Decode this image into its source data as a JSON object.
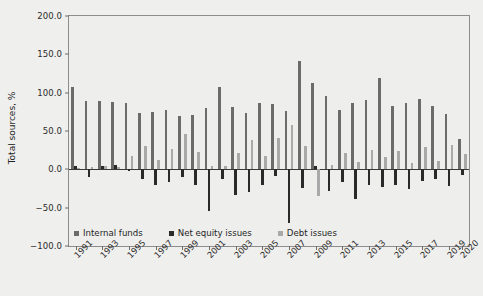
{
  "chart_data": {
    "type": "bar",
    "title": "",
    "xlabel": "",
    "ylabel": "Total sources, %",
    "ylim": [
      -100.0,
      200.0
    ],
    "yticks": [
      200.0,
      150.0,
      100.0,
      50.0,
      0.0,
      -50.0,
      -100.0
    ],
    "ytick_labels": [
      "200.0",
      "150.0",
      "100.0",
      "50.0",
      "0.0",
      "-50.0",
      "-100.0"
    ],
    "grid": false,
    "legend_position": "bottom-left",
    "categories": [
      1991,
      1992,
      1993,
      1994,
      1995,
      1996,
      1997,
      1998,
      1999,
      2000,
      2001,
      2002,
      2003,
      2004,
      2005,
      2006,
      2007,
      2008,
      2009,
      2010,
      2011,
      2012,
      2013,
      2014,
      2015,
      2016,
      2017,
      2018,
      2019,
      2020
    ],
    "xtick_labels": [
      "1991",
      "1993",
      "1995",
      "1997",
      "1999",
      "2001",
      "2003",
      "2005",
      "2007",
      "2009",
      "2011",
      "2013",
      "2015",
      "2017",
      "2019",
      "2020"
    ],
    "series": [
      {
        "name": "Internal funds",
        "color": "#6b6b6b",
        "values": [
          108,
          89,
          89,
          88,
          86,
          74,
          75,
          78,
          70,
          71,
          80,
          107,
          81,
          74,
          87,
          85,
          76,
          141,
          112,
          96,
          78,
          87,
          90,
          119,
          82,
          87,
          92,
          83,
          72,
          40
        ]
      },
      {
        "name": "Net equity issues",
        "color": "#2a2a2a",
        "values": [
          5,
          -10,
          5,
          6,
          -2,
          -13,
          -21,
          -17,
          -10,
          -21,
          -55,
          -12,
          -33,
          -29,
          -21,
          -9,
          -70,
          -25,
          5,
          -28,
          -16,
          -39,
          -21,
          -23,
          -20,
          -26,
          -15,
          -13,
          -22,
          -8
        ]
      },
      {
        "name": "Debt issues",
        "color": "#a9a9a9",
        "values": [
          2,
          3,
          4,
          3,
          17,
          31,
          12,
          26,
          46,
          22,
          5,
          5,
          21,
          38,
          17,
          41,
          58,
          30,
          -35,
          6,
          21,
          9,
          25,
          16,
          24,
          8,
          29,
          11,
          32,
          20
        ]
      }
    ]
  },
  "legend": {
    "items": [
      {
        "label": "Internal funds"
      },
      {
        "label": "Net equity issues"
      },
      {
        "label": "Debt issues"
      }
    ]
  }
}
